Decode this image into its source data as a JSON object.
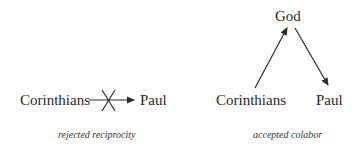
{
  "left_diagram": {
    "from": "Corinthians",
    "to": "Paul",
    "edge_status": "crossed-out",
    "caption": "rejected reciprocity"
  },
  "right_diagram": {
    "top": "God",
    "left": "Corinthians",
    "right": "Paul",
    "caption": "accepted colabor"
  }
}
